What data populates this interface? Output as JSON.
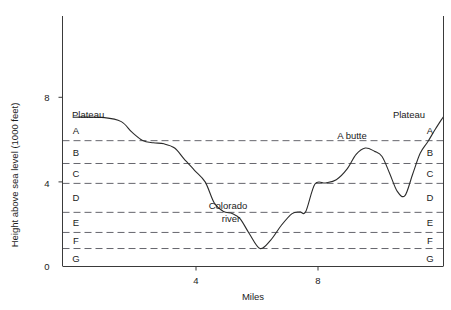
{
  "chart_data": {
    "type": "line",
    "title": "",
    "subtitle": "",
    "xlabel": "Miles",
    "ylabel": "Height above sea level (1000 feet)",
    "xlim": [
      0,
      12.1
    ],
    "ylim": [
      0,
      8.8
    ],
    "grid": "horizontal-dashed-strata-boundaries",
    "legend": "none",
    "xticks": [
      4,
      8
    ],
    "xtick_labels": [
      "4",
      "8"
    ],
    "yticks": [
      0,
      4,
      8
    ],
    "ytick_labels": [
      "0",
      "4",
      "8"
    ],
    "series": [
      {
        "name": "Canyon terrain profile",
        "x": [
          0.0,
          1.0,
          1.55,
          1.9,
          2.25,
          2.6,
          2.95,
          3.3,
          3.6,
          3.95,
          4.3,
          4.6,
          4.9,
          5.2,
          5.45,
          5.75,
          6.1,
          6.45,
          6.8,
          7.15,
          7.4,
          7.6,
          7.9,
          8.25,
          8.6,
          8.95,
          9.25,
          9.55,
          9.85,
          10.1,
          10.35,
          10.6,
          10.85,
          11.1,
          11.35,
          11.6,
          11.85,
          12.1
        ],
        "y": [
          7.06,
          7.04,
          6.85,
          6.35,
          5.96,
          5.85,
          5.8,
          5.6,
          5.1,
          4.55,
          4.0,
          3.0,
          2.6,
          2.5,
          2.25,
          1.55,
          0.85,
          1.25,
          1.95,
          2.5,
          2.58,
          2.6,
          3.9,
          3.95,
          4.1,
          4.6,
          5.3,
          5.6,
          5.45,
          5.2,
          4.4,
          3.55,
          3.35,
          4.35,
          5.35,
          5.9,
          6.5,
          7.06
        ]
      }
    ],
    "strata_boundaries": [
      {
        "name": "plateau-top",
        "value": 7.06
      },
      {
        "name": "A-B",
        "value": 5.95
      },
      {
        "name": "B-C",
        "value": 4.87
      },
      {
        "name": "C-D",
        "value": 3.93
      },
      {
        "name": "D-E",
        "value": 2.56
      },
      {
        "name": "E-F",
        "value": 1.61
      },
      {
        "name": "F-G",
        "value": 0.85
      }
    ],
    "annotations": [
      {
        "name": "plateau-left",
        "text": "Plateau",
        "x": 0.35,
        "y": 7.5
      },
      {
        "name": "plateau-right",
        "text": "Plateau",
        "x": 11.0,
        "y": 7.5
      },
      {
        "name": "a-butte",
        "text": "A butte",
        "x": 8.55,
        "y": 6.35
      },
      {
        "name": "colorado-river-line1",
        "text": "Colorado",
        "x": 5.4,
        "y": 2.85
      },
      {
        "name": "colorado-river-line2",
        "text": "river",
        "x": 5.75,
        "y": 2.25
      }
    ],
    "strata_labels_left": [
      {
        "letter": "A",
        "y": 6.45
      },
      {
        "letter": "B",
        "y": 5.4
      },
      {
        "letter": "C",
        "y": 4.38
      },
      {
        "letter": "D",
        "y": 3.25
      },
      {
        "letter": "E",
        "y": 2.1
      },
      {
        "letter": "F",
        "y": 1.22
      },
      {
        "letter": "G",
        "y": 0.4
      }
    ],
    "strata_labels_right": [
      {
        "letter": "A",
        "y": 6.45
      },
      {
        "letter": "B",
        "y": 5.4
      },
      {
        "letter": "C",
        "y": 4.38
      },
      {
        "letter": "D",
        "y": 3.25
      },
      {
        "letter": "E",
        "y": 2.1
      },
      {
        "letter": "F",
        "y": 1.22
      },
      {
        "letter": "G",
        "y": 0.4
      }
    ],
    "colors": {
      "profile_line": "#2b2b2b",
      "strata_line": "#55555c",
      "axis": "#3a3a3a",
      "background": "#ffffff",
      "text": "#1b1b1b"
    }
  }
}
